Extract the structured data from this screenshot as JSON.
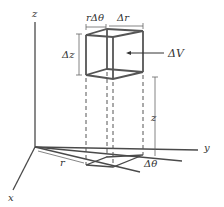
{
  "figure": {
    "axes": {
      "x": "x",
      "y": "y",
      "z": "z"
    },
    "labels": {
      "r_dtheta": "rΔθ",
      "dr": "Δr",
      "dz": "Δz",
      "dV": "ΔV",
      "z_height": "z",
      "r_radius": "r",
      "dtheta": "Δθ"
    }
  }
}
